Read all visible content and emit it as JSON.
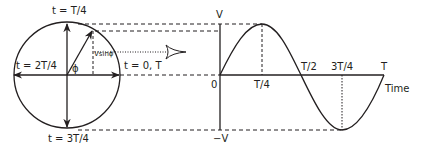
{
  "diagram": {
    "circle_labels": {
      "top": "t = T/4",
      "left": "t = 2T/4",
      "right": "t = 0, T",
      "bottom": "t = 3T/4",
      "angle": "ϕ",
      "projection": "Vsinϕ"
    },
    "graph_labels": {
      "y_max": "V",
      "y_min": "−V",
      "origin": "0",
      "t_quarter": "T/4",
      "t_half": "T/2",
      "t_three_quarter": "3T/4",
      "t_full": "T",
      "x_axis": "Time"
    },
    "colors": {
      "line": "#231f20",
      "background": "#ffffff"
    }
  }
}
